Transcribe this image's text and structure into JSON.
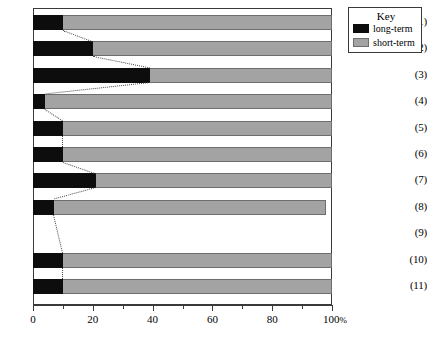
{
  "chart_data": {
    "type": "bar",
    "orientation": "horizontal",
    "stacked": true,
    "title": "",
    "xlabel": "",
    "ylabel": "",
    "xlim": [
      0,
      100
    ],
    "grid": false,
    "categories": [
      "(1)",
      "(2)",
      "(3)",
      "(4)",
      "(5)",
      "(6)",
      "(7)",
      "(8)",
      "(9)",
      "(10)",
      "(11)"
    ],
    "series": [
      {
        "name": "long-term",
        "color": "#0d0d0d",
        "values": [
          10,
          20,
          39,
          4,
          10,
          10,
          21,
          7,
          0,
          10,
          10
        ]
      },
      {
        "name": "short-term",
        "color": "#a3a3a3",
        "values": [
          90,
          80,
          61,
          96,
          90,
          90,
          79,
          91,
          0,
          90,
          90
        ]
      }
    ],
    "xticks_major": [
      0,
      20,
      40,
      60,
      80,
      100
    ],
    "xtick_labels": [
      "0",
      "20",
      "40",
      "60",
      "80",
      "100"
    ],
    "xticks_minor": [
      10,
      30,
      50,
      70,
      90
    ],
    "axis_unit_suffix": "%",
    "annotations": {
      "connectors_note": "dotted lines link the long-term/short-term boundary of each bar to the next"
    }
  },
  "legend": {
    "title": "Key",
    "items": [
      {
        "label": "long-term",
        "color": "#0d0d0d"
      },
      {
        "label": "short-term",
        "color": "#a3a3a3"
      }
    ]
  }
}
